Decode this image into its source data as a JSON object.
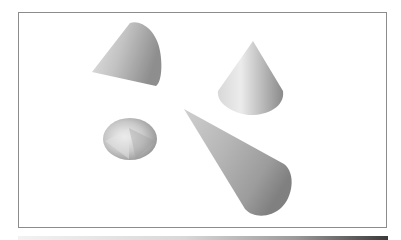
{
  "figure": {
    "frame_border_color": "#8c8c8c",
    "cones": [
      {
        "name": "cone-tilted-top-left",
        "orientation": "apex pointing left, base facing right-up"
      },
      {
        "name": "cone-upright-top-right",
        "orientation": "apex pointing up"
      },
      {
        "name": "cone-viewed-from-top",
        "orientation": "apex pointing toward viewer"
      },
      {
        "name": "cone-elongated-center",
        "orientation": "apex pointing upper-left, base lower-right"
      }
    ]
  },
  "bottom_bar": {
    "gradient_start": "#f2f2f2",
    "gradient_end": "#3a3a3a"
  }
}
